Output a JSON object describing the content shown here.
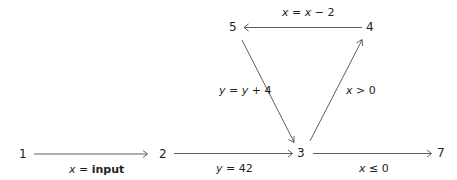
{
  "diagram": {
    "type": "control-flow-graph",
    "nodes": [
      {
        "id": "1",
        "label": "1"
      },
      {
        "id": "2",
        "label": "2"
      },
      {
        "id": "3",
        "label": "3"
      },
      {
        "id": "4",
        "label": "4"
      },
      {
        "id": "5",
        "label": "5"
      },
      {
        "id": "7",
        "label": "7"
      }
    ],
    "edges": [
      {
        "from": "1",
        "to": "2",
        "label_var": "x",
        "label_op": " = ",
        "label_val": "input"
      },
      {
        "from": "2",
        "to": "3",
        "label_var": "y",
        "label_op": " = ",
        "label_val": "42"
      },
      {
        "from": "3",
        "to": "7",
        "label_var": "x",
        "label_op": " ≤ ",
        "label_val": "0"
      },
      {
        "from": "3",
        "to": "4",
        "label_var": "x",
        "label_op": " > ",
        "label_val": "0"
      },
      {
        "from": "4",
        "to": "5",
        "label_var": "x",
        "label_op": " = ",
        "label_var2": "x",
        "label_rest": " − 2"
      },
      {
        "from": "5",
        "to": "3",
        "label_var": "y",
        "label_op": " = ",
        "label_var2": "y",
        "label_rest": " + 4"
      }
    ]
  }
}
